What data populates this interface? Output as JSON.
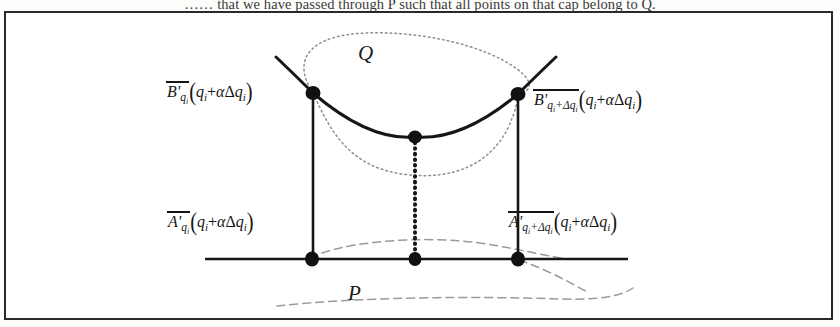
{
  "caption": {
    "text": "…… that we have passed through P such that all points on that cap belong to Q."
  },
  "figure": {
    "frame_color": "#29292a",
    "ink_color": "#161616",
    "faint_color": "#8d8d8f",
    "region_labels": {
      "upper": "Q",
      "lower": "P"
    },
    "point_labels": {
      "upper_left": {
        "head": "B'",
        "sub": "q",
        "sub_index": "i",
        "arg_open": "(",
        "arg": "q",
        "arg_index": "i",
        "arg_plus": "+",
        "arg_alpha": "α",
        "arg_delta": "Δ",
        "arg_q": "q",
        "arg_q_index": "i",
        "arg_close": ")"
      },
      "upper_right": {
        "head": "B'",
        "sub": "q",
        "sub_index": "i",
        "sub_plus": "+",
        "sub_delta": "Δ",
        "sub_q": "q",
        "sub_q_index": "i",
        "arg_open": "(",
        "arg": "q",
        "arg_index": "i",
        "arg_plus": "+",
        "arg_alpha": "α",
        "arg_delta": "Δ",
        "arg_q": "q",
        "arg_q_index": "i",
        "arg_close": ")"
      },
      "lower_left": {
        "head": "A'",
        "sub": "q",
        "sub_index": "i",
        "arg_open": "(",
        "arg": "q",
        "arg_index": "i",
        "arg_plus": "+",
        "arg_alpha": "α",
        "arg_delta": "Δ",
        "arg_q": "q",
        "arg_q_index": "i",
        "arg_close": ")"
      },
      "lower_right": {
        "head": "A'",
        "sub": "q",
        "sub_index": "i",
        "sub_plus": "+",
        "sub_delta": "Δ",
        "sub_q": "q",
        "sub_q_index": "i",
        "arg_open": "(",
        "arg": "q",
        "arg_index": "i",
        "arg_plus": "+",
        "arg_alpha": "α",
        "arg_delta": "Δ",
        "arg_q": "q",
        "arg_q_index": "i",
        "arg_close": ")"
      }
    },
    "geometry": {
      "points": [
        {
          "name": "upper-left-node",
          "x": 313,
          "y": 93
        },
        {
          "name": "upper-right-node",
          "x": 518,
          "y": 94
        },
        {
          "name": "curve-mid-node",
          "x": 415,
          "y": 137
        },
        {
          "name": "lower-left-node",
          "x": 312,
          "y": 259
        },
        {
          "name": "lower-mid-node",
          "x": 415,
          "y": 259
        },
        {
          "name": "lower-right-node",
          "x": 518,
          "y": 259
        }
      ],
      "baseline": {
        "x1": 205,
        "x2": 628,
        "y": 259
      },
      "solid_curve": "M 276 57 Q 300 80 313 93 Q 370 140 415 137 Q 462 140 518 94 Q 534 80 556 57",
      "left_riser": {
        "x": 313,
        "y1": 93,
        "y2": 259
      },
      "right_riser": {
        "x": 518,
        "y1": 94,
        "y2": 259
      },
      "dotted_riser": {
        "x": 415,
        "y1": 137,
        "y2": 259
      },
      "q_blob_top": "M 313 93 C 290 58 312 35 366 33 C 424 31 486 46 517 69 C 536 83 530 92 518 94",
      "q_blob_bottom": "M 313 93 C 330 130 348 166 402 174 C 458 182 492 160 508 128 C 516 110 518 100 518 94",
      "p_blob_top": "M 322 253 C 360 240 430 236 480 243 C 520 249 540 255 560 258",
      "p_blob_right": "M 518 259 C 545 268 570 282 588 292",
      "p_blob_bottom": "M 280 305 C 360 296 470 296 560 298 C 600 299 620 296 632 288"
    }
  }
}
